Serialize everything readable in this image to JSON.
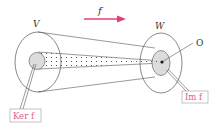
{
  "diagram": {
    "arrow_label": "f",
    "domain_label": "V",
    "codomain_label": "W",
    "origin_label": "O",
    "kernel_label": "Ker f",
    "image_label": "Im f",
    "colors": {
      "arrow": "#e0406e",
      "label_box_text": "#e0608a",
      "shaded": "#dcdcdc",
      "stroke": "#555555"
    }
  }
}
